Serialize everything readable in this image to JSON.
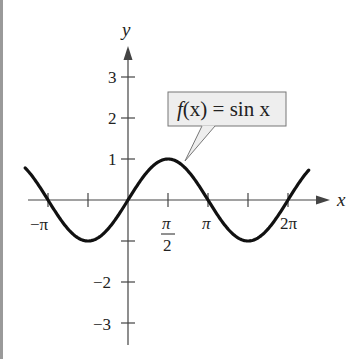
{
  "chart_data": {
    "type": "line",
    "title": "",
    "function_label": "f(x) = sin x",
    "xlabel": "x",
    "ylabel": "y",
    "xlim": [
      -4.2,
      7.0
    ],
    "ylim": [
      -3.5,
      3.8
    ],
    "grid": false,
    "x_ticks": [
      {
        "value": -3.14159,
        "label": "−π"
      },
      {
        "value": -1.5708,
        "label": ""
      },
      {
        "value": 1.5708,
        "label": "π/2"
      },
      {
        "value": 3.14159,
        "label": "π"
      },
      {
        "value": 4.71239,
        "label": ""
      },
      {
        "value": 6.28319,
        "label": "2π"
      }
    ],
    "y_ticks": [
      {
        "value": 3,
        "label": "3"
      },
      {
        "value": 2,
        "label": "2"
      },
      {
        "value": 1,
        "label": "1"
      },
      {
        "value": -1,
        "label": ""
      },
      {
        "value": -2,
        "label": "−2"
      },
      {
        "value": -3,
        "label": "−3"
      }
    ],
    "series": [
      {
        "name": "f(x) = sin x",
        "x": [
          -4.04,
          -3.14159,
          -1.5708,
          0,
          1.5708,
          3.14159,
          4.71239,
          6.28319,
          7.1
        ],
        "y": [
          0.78,
          0,
          -1,
          0,
          1,
          0,
          -1,
          0,
          0.73
        ]
      }
    ]
  },
  "labels": {
    "x_axis": "x",
    "y_axis": "y",
    "callout_f": "f",
    "callout_rest": "(x) = sin x",
    "tick_neg_pi": "−π",
    "tick_pi_num": "π",
    "tick_pi_den": "2",
    "tick_pi": "π",
    "tick_2pi": "2π",
    "y3": "3",
    "y2": "2",
    "y1": "1",
    "yn2": "−2",
    "yn3": "−3"
  }
}
